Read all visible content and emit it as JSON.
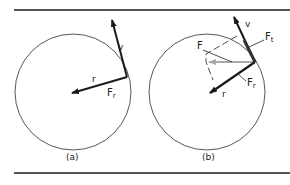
{
  "figure": {
    "panels": [
      {
        "id": "a",
        "caption": "(a)",
        "labels": {
          "v": "v",
          "r": "r",
          "Fr": "F",
          "Fr_sub": "r"
        }
      },
      {
        "id": "b",
        "caption": "(b)",
        "labels": {
          "v": "v",
          "r": "r",
          "F": "F",
          "Ft": "F",
          "Ft_sub": "t",
          "Fr": "F",
          "Fr_sub": "r"
        }
      }
    ],
    "colors": {
      "rule": "#555555",
      "circle": "#444444",
      "vector": "#1a1a1a",
      "net_force": "#aaaaaa",
      "construction": "#222222"
    }
  }
}
